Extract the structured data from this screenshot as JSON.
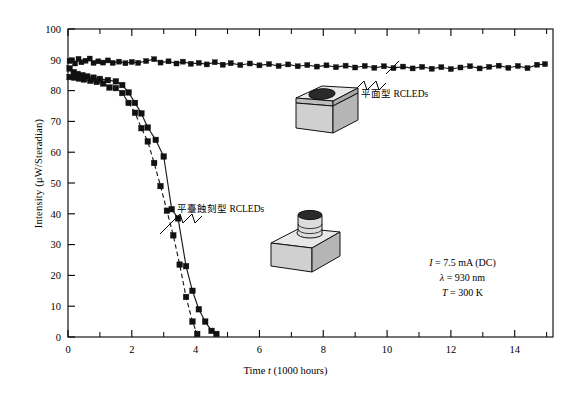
{
  "chart_data": {
    "type": "line",
    "title": "",
    "xlabel": "Time t (1000 hours)",
    "ylabel": "Intensity (μW/Steradian)",
    "xlim": [
      0,
      15.2
    ],
    "ylim": [
      0,
      100
    ],
    "xticks": [
      0,
      2,
      4,
      6,
      8,
      10,
      12,
      14
    ],
    "xticks_minor": [
      1,
      3,
      5,
      7,
      9,
      11,
      13,
      15
    ],
    "yticks": [
      0,
      10,
      20,
      30,
      40,
      50,
      60,
      70,
      80,
      90,
      100
    ],
    "grid": false,
    "legend_position": "annotations-inline",
    "series": [
      {
        "name": "平面型 RCLEDs",
        "style": "solid",
        "marker": "filled-square",
        "points": [
          [
            0.05,
            89.6
          ],
          [
            0.12,
            89.9
          ],
          [
            0.22,
            88.8
          ],
          [
            0.33,
            90.3
          ],
          [
            0.42,
            89.2
          ],
          [
            0.55,
            89.7
          ],
          [
            0.68,
            90.4
          ],
          [
            0.8,
            89.0
          ],
          [
            0.95,
            89.5
          ],
          [
            1.1,
            89.1
          ],
          [
            1.25,
            89.8
          ],
          [
            1.4,
            89.0
          ],
          [
            1.6,
            89.4
          ],
          [
            1.8,
            88.9
          ],
          [
            2.0,
            89.3
          ],
          [
            2.2,
            89.0
          ],
          [
            2.45,
            89.6
          ],
          [
            2.7,
            90.2
          ],
          [
            2.9,
            89.1
          ],
          [
            3.15,
            89.5
          ],
          [
            3.4,
            88.8
          ],
          [
            3.6,
            89.4
          ],
          [
            3.85,
            88.7
          ],
          [
            4.1,
            89.0
          ],
          [
            4.35,
            88.5
          ],
          [
            4.6,
            89.2
          ],
          [
            4.85,
            88.4
          ],
          [
            5.1,
            88.9
          ],
          [
            5.4,
            88.3
          ],
          [
            5.7,
            88.8
          ],
          [
            6.0,
            88.2
          ],
          [
            6.3,
            88.6
          ],
          [
            6.6,
            88.0
          ],
          [
            6.9,
            88.5
          ],
          [
            7.2,
            87.9
          ],
          [
            7.5,
            88.3
          ],
          [
            7.8,
            87.8
          ],
          [
            8.1,
            88.2
          ],
          [
            8.4,
            87.6
          ],
          [
            8.7,
            88.1
          ],
          [
            9.0,
            87.5
          ],
          [
            9.3,
            88.0
          ],
          [
            9.6,
            87.4
          ],
          [
            9.9,
            87.9
          ],
          [
            10.2,
            87.3
          ],
          [
            10.5,
            87.8
          ],
          [
            10.8,
            87.2
          ],
          [
            11.1,
            87.7
          ],
          [
            11.4,
            87.1
          ],
          [
            11.7,
            87.6
          ],
          [
            12.0,
            87.0
          ],
          [
            12.3,
            87.5
          ],
          [
            12.6,
            87.9
          ],
          [
            12.9,
            87.2
          ],
          [
            13.2,
            87.7
          ],
          [
            13.5,
            88.1
          ],
          [
            13.8,
            87.4
          ],
          [
            14.1,
            88.0
          ],
          [
            14.4,
            87.3
          ],
          [
            14.7,
            88.4
          ],
          [
            14.95,
            88.6
          ]
        ]
      },
      {
        "name": "平臺蝕刻型 RCLEDs (solid)",
        "style": "solid",
        "marker": "filled-square",
        "points": [
          [
            0.05,
            87.2
          ],
          [
            0.18,
            86.0
          ],
          [
            0.3,
            85.4
          ],
          [
            0.45,
            85.0
          ],
          [
            0.6,
            84.6
          ],
          [
            0.8,
            84.2
          ],
          [
            1.0,
            83.8
          ],
          [
            1.25,
            83.4
          ],
          [
            1.5,
            83.0
          ],
          [
            1.7,
            81.8
          ],
          [
            1.9,
            79.4
          ],
          [
            2.1,
            76.0
          ],
          [
            2.3,
            72.6
          ],
          [
            2.5,
            68.0
          ],
          [
            2.75,
            64.0
          ],
          [
            3.0,
            58.6
          ],
          [
            3.25,
            41.5
          ],
          [
            3.45,
            38.5
          ],
          [
            3.7,
            23.0
          ],
          [
            3.9,
            15.0
          ],
          [
            4.1,
            9.0
          ],
          [
            4.3,
            5.0
          ],
          [
            4.5,
            2.0
          ],
          [
            4.65,
            1.0
          ]
        ]
      },
      {
        "name": "平臺蝕刻型 RCLEDs (dashed)",
        "style": "dashed",
        "marker": "filled-square",
        "points": [
          [
            0.05,
            84.4
          ],
          [
            0.2,
            84.2
          ],
          [
            0.35,
            83.9
          ],
          [
            0.5,
            83.6
          ],
          [
            0.7,
            83.2
          ],
          [
            0.9,
            82.8
          ],
          [
            1.1,
            82.3
          ],
          [
            1.3,
            81.0
          ],
          [
            1.5,
            80.8
          ],
          [
            1.7,
            79.2
          ],
          [
            1.9,
            76.0
          ],
          [
            2.1,
            72.8
          ],
          [
            2.3,
            67.8
          ],
          [
            2.5,
            63.5
          ],
          [
            2.7,
            56.5
          ],
          [
            2.9,
            49.0
          ],
          [
            3.1,
            41.0
          ],
          [
            3.3,
            33.0
          ],
          [
            3.5,
            23.5
          ],
          [
            3.7,
            13.0
          ],
          [
            3.9,
            5.0
          ],
          [
            4.05,
            1.0
          ]
        ]
      }
    ],
    "annotations": [
      {
        "name": "planar-label",
        "text": "平面型 RCLEDs"
      },
      {
        "name": "mesa-label",
        "text": "平臺蝕刻型 RCLEDs"
      }
    ]
  },
  "axes": {
    "xlabel_prefix": "Time ",
    "xlabel_italic": "t",
    "xlabel_suffix": " (1000 hours)",
    "ylabel": "Intensity (μW/Steradian)"
  },
  "annotations": {
    "planar": "平面型 RCLEDs",
    "mesa": "平臺蝕刻型 RCLEDs"
  },
  "params": {
    "current_symbol": "I",
    "current_value": " = 7.5 mA (DC)",
    "wavelength_symbol": "λ",
    "wavelength_value": " = 930 nm",
    "temperature_symbol": "T",
    "temperature_value": " = 300 K"
  },
  "colors": {
    "line": "#1a1a1a",
    "marker": "#111111",
    "axis": "#000000",
    "device_fill": "#d0d0d0",
    "device_top": "#e8e8e8",
    "device_aperture": "#2a2a2a"
  }
}
